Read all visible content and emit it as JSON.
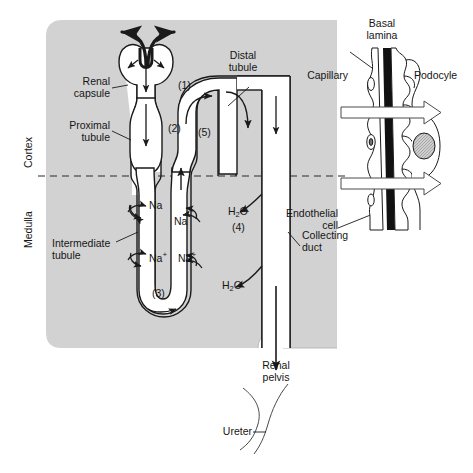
{
  "figure": {
    "title_present": false,
    "background_color": "#ffffff",
    "kidney_panel_color": "#d2d2d2",
    "stroke_color": "#1a1a1a",
    "lumen_color": "#ffffff"
  },
  "zones": {
    "cortex": "Cortex",
    "medulla": "Medulla"
  },
  "nephron_labels": {
    "renal_capsule": "Renal\ncapsule",
    "proximal_tubule": "Proximal\ntubule",
    "intermediate_tubule": "Intermediate\ntubule",
    "distal_tubule": "Distal\ntubule",
    "collecting_duct": "Collecting\nduct",
    "renal_pelvis": "Renal\npelvis",
    "ureter": "Ureter"
  },
  "numbered_callouts": [
    {
      "id": "1",
      "text": "(1)",
      "refers_to": "renal capsule / glomerulus"
    },
    {
      "id": "2",
      "text": "(2)",
      "refers_to": "proximal tubule"
    },
    {
      "id": "3",
      "text": "(3)",
      "refers_to": "intermediate tubule / loop of Henle"
    },
    {
      "id": "4",
      "text": "(4)",
      "refers_to": "water reabsorption at collecting duct"
    },
    {
      "id": "5",
      "text": "(5)",
      "refers_to": "distal tubule"
    }
  ],
  "transport_labels": [
    {
      "id": "na-left-upper",
      "species": "Na",
      "sup": "",
      "direction": "out of ascending limb"
    },
    {
      "id": "na-right-upper",
      "species": "Na",
      "sup": "",
      "direction": "out of descending limb"
    },
    {
      "id": "na-left-lower",
      "species": "Na",
      "sup": "+",
      "direction": "out of ascending limb"
    },
    {
      "id": "na-right-lower",
      "species": "Na",
      "sup": "+",
      "direction": "out of descending limb"
    },
    {
      "id": "h2o-upper",
      "species": "H",
      "sub": "2",
      "species2": "O",
      "direction": "out of collecting duct"
    },
    {
      "id": "h2o-lower",
      "species": "H",
      "sub": "2",
      "species2": "O",
      "direction": "out of collecting duct"
    }
  ],
  "inset": {
    "title_basal_lamina": "Basal\nlamina",
    "capillary": "Capillary",
    "podocyte": "Podocyle",
    "endothelial_cell": "Endothelial\ncell",
    "filtration_arrows": 2
  }
}
